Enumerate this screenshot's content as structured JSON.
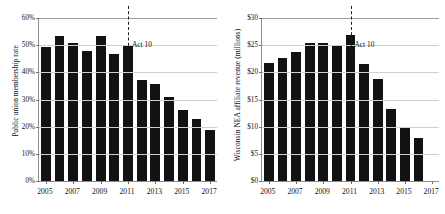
{
  "figure": {
    "background": "#ffffff",
    "bar_color": "#121212",
    "grid_color": "#cfcfcf",
    "axis_color": "#8e8e8e"
  },
  "chart_data": [
    {
      "type": "bar",
      "panel": "left",
      "title": "",
      "xlabel": "",
      "ylabel": "Public union membership rate",
      "ylim": [
        0,
        60
      ],
      "ytick_labels": [
        "0%",
        "10%",
        "20%",
        "30%",
        "40%",
        "50%",
        "60%"
      ],
      "ytick_values": [
        0,
        10,
        20,
        30,
        40,
        50,
        60
      ],
      "xlim": [
        2004.5,
        2017.5
      ],
      "xtick_labels": [
        "2005",
        "2007",
        "2009",
        "2011",
        "2013",
        "2015",
        "2017"
      ],
      "xtick_values": [
        2005,
        2007,
        2009,
        2011,
        2013,
        2015,
        2017
      ],
      "grid": true,
      "legend": "none",
      "categories": [
        2005,
        2006,
        2007,
        2008,
        2009,
        2010,
        2011,
        2012,
        2013,
        2014,
        2015,
        2016,
        2017
      ],
      "values": [
        49.4,
        53.5,
        50.8,
        47.8,
        53.3,
        46.6,
        50.2,
        37.3,
        35.8,
        31.0,
        26.0,
        22.7,
        18.8
      ],
      "annotations": [
        {
          "label": "Act 10",
          "x": 2011,
          "style": "dashed-vertical-line"
        }
      ]
    },
    {
      "type": "bar",
      "panel": "right",
      "title": "",
      "xlabel": "",
      "ylabel": "Wisconsin NEA affiliate revenue (millions)",
      "ylim": [
        0,
        30
      ],
      "ytick_labels": [
        "$0",
        "$5",
        "$10",
        "$15",
        "$20",
        "$25",
        "$30"
      ],
      "ytick_values": [
        0,
        5,
        10,
        15,
        20,
        25,
        30
      ],
      "xlim": [
        2004.5,
        2017.5
      ],
      "xtick_labels": [
        "2005",
        "2007",
        "2009",
        "2011",
        "2013",
        "2015",
        "2017"
      ],
      "xtick_values": [
        2005,
        2007,
        2009,
        2011,
        2013,
        2015,
        2017
      ],
      "grid": true,
      "legend": "none",
      "categories": [
        2005,
        2006,
        2007,
        2008,
        2009,
        2010,
        2011,
        2012,
        2013,
        2014,
        2015,
        2016
      ],
      "values": [
        21.7,
        22.6,
        23.8,
        25.4,
        25.4,
        25.1,
        26.8,
        21.5,
        18.8,
        13.2,
        9.8,
        8.0
      ],
      "annotations": [
        {
          "label": "Act 10",
          "x": 2011,
          "style": "dashed-vertical-line"
        }
      ]
    }
  ]
}
